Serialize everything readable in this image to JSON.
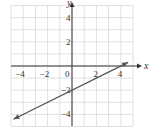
{
  "chart_data": {
    "type": "line",
    "title": "",
    "xlabel": "x",
    "ylabel": "y",
    "xlim": [
      -5,
      5
    ],
    "ylim": [
      -5,
      5
    ],
    "grid": true,
    "x_ticks": [
      -4,
      -2,
      0,
      2,
      4
    ],
    "x_tick_labels": [
      "−4",
      "−2",
      "0",
      "2",
      "4"
    ],
    "y_ticks": [
      4,
      2,
      -2,
      -4
    ],
    "y_tick_labels": [
      "4",
      "2",
      "−2",
      "−4"
    ],
    "series": [
      {
        "name": "y = 0.5x - 2",
        "equation": "y = 0.5x - 2",
        "x": [
          -4.8,
          0,
          4,
          4.6
        ],
        "y": [
          -4.4,
          -2,
          0,
          0.3
        ],
        "arrows": "both",
        "color": "#555555"
      }
    ]
  }
}
